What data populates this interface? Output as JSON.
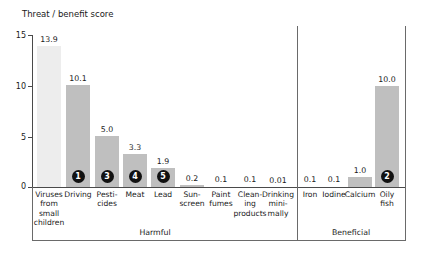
{
  "chart_data": {
    "type": "bar",
    "title": "Threat / benefit score",
    "xlabel": "",
    "ylabel": "Threat / benefit score",
    "ylim": [
      0,
      15
    ],
    "yticks": [
      0,
      5,
      10,
      15
    ],
    "ytick_labels": [
      "0",
      "5",
      "10",
      "15"
    ],
    "grid": false,
    "legend": null,
    "categories": [
      "Viruses from small children",
      "Driving",
      "Pesticides",
      "Meat",
      "Lead",
      "Sunscreen",
      "Paint fumes",
      "Cleaning products",
      "Drinking minimally",
      "Iron",
      "Iodine",
      "Calcium",
      "Oily fish"
    ],
    "values": [
      13.9,
      10.1,
      5.0,
      3.3,
      1.9,
      0.2,
      0.1,
      0.1,
      0.01,
      0.1,
      0.1,
      1.0,
      10.0
    ],
    "value_labels": [
      "13.9",
      "10.1",
      "5.0",
      "3.3",
      "1.9",
      "0.2",
      "0.1",
      "0.1",
      "0.01",
      "0.1",
      "0.1",
      "1.0",
      "10.0"
    ],
    "rank_badges": [
      "",
      "1",
      "3",
      "4",
      "5",
      "",
      "",
      "",
      "",
      "",
      "",
      "",
      "2"
    ],
    "groups": [
      {
        "label": "Harmful",
        "categories": 9
      },
      {
        "label": "Beneficial",
        "categories": 4
      }
    ],
    "colors": {
      "bar_light": "#ededed",
      "bar_mid": "#bfbfbf",
      "badge": "#111111",
      "axis": "#4a4a4a"
    }
  },
  "axis": {
    "ticks": [
      {
        "label": "15"
      },
      {
        "label": "10"
      },
      {
        "label": "5"
      },
      {
        "label": "0"
      }
    ]
  },
  "bars": [
    {
      "label_lines": [
        "Viruses",
        "from",
        "small",
        "children"
      ],
      "value": "13.9",
      "badge": ""
    },
    {
      "label_lines": [
        "Driving"
      ],
      "value": "10.1",
      "badge": "1"
    },
    {
      "label_lines": [
        "Pesti-",
        "cides"
      ],
      "value": "5.0",
      "badge": "3"
    },
    {
      "label_lines": [
        "Meat"
      ],
      "value": "3.3",
      "badge": "4"
    },
    {
      "label_lines": [
        "Lead"
      ],
      "value": "1.9",
      "badge": "5"
    },
    {
      "label_lines": [
        "Sun-",
        "screen"
      ],
      "value": "0.2",
      "badge": ""
    },
    {
      "label_lines": [
        "Paint",
        "fumes"
      ],
      "value": "0.1",
      "badge": ""
    },
    {
      "label_lines": [
        "Clean-",
        "ing",
        "products"
      ],
      "value": "0.1",
      "badge": ""
    },
    {
      "label_lines": [
        "Drinking",
        "mini-",
        "mally"
      ],
      "value": "0.01",
      "badge": ""
    },
    {
      "label_lines": [
        "Iron"
      ],
      "value": "0.1",
      "badge": ""
    },
    {
      "label_lines": [
        "Iodine"
      ],
      "value": "0.1",
      "badge": ""
    },
    {
      "label_lines": [
        "Calcium"
      ],
      "value": "1.0",
      "badge": ""
    },
    {
      "label_lines": [
        "Oily",
        "fish"
      ],
      "value": "10.0",
      "badge": "2"
    }
  ],
  "groups": [
    {
      "label": "Harmful"
    },
    {
      "label": "Beneficial"
    }
  ]
}
